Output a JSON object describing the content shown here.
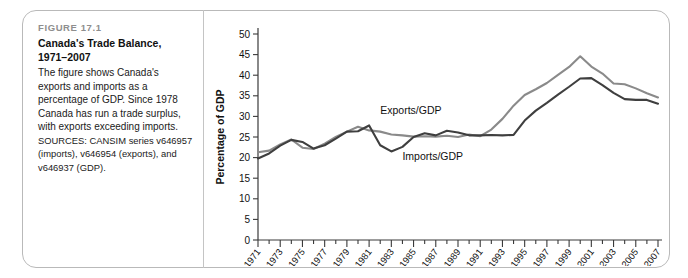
{
  "caption": {
    "figure_number": "FIGURE 17.1",
    "title_line1": "Canada's Trade Balance,",
    "title_line2": "1971–2007",
    "body": "The figure shows Canada's exports and imports as a percentage of GDP. Since 1978 Canada has run a trade surplus, with exports exceeding imports.",
    "sources": "SOURCES: CANSIM series v646957 (imports), v646954 (exports), and v646937 (GDP)."
  },
  "colors": {
    "exports_line": "#8a8a8a",
    "imports_line": "#3f3f3f",
    "axis": "#3a3a3a",
    "card_border": "#b9b9b9",
    "figure_number_text": "#8e8e8e"
  },
  "chart_data": {
    "type": "line",
    "title": "",
    "xlabel": "",
    "ylabel": "Percentage of GDP",
    "ylim": [
      0,
      50
    ],
    "ytick_values": [
      0,
      5,
      10,
      15,
      20,
      25,
      30,
      35,
      40,
      45,
      50
    ],
    "ytick_labels": [
      "0",
      "5",
      "10",
      "15",
      "20",
      "25",
      "30",
      "35",
      "40",
      "45",
      "50"
    ],
    "xlim": [
      1971,
      2007
    ],
    "x": [
      1971,
      1972,
      1973,
      1974,
      1975,
      1976,
      1977,
      1978,
      1979,
      1980,
      1981,
      1982,
      1983,
      1984,
      1985,
      1986,
      1987,
      1988,
      1989,
      1990,
      1991,
      1992,
      1993,
      1994,
      1995,
      1996,
      1997,
      1998,
      1999,
      2000,
      2001,
      2002,
      2003,
      2004,
      2005,
      2006,
      2007
    ],
    "xtick_labels": [
      "1971",
      "1973",
      "1975",
      "1977",
      "1979",
      "1981",
      "1983",
      "1985",
      "1987",
      "1989",
      "1991",
      "1993",
      "1995",
      "1997",
      "1999",
      "2001",
      "2003",
      "2005",
      "2007"
    ],
    "xtick_label_step": 2,
    "grid": false,
    "legend_position": "inline-annotation",
    "series": [
      {
        "name": "Exports/GDP",
        "color": "#8a8a8a",
        "values": [
          21.3,
          21.7,
          23.2,
          24.4,
          22.4,
          22.1,
          23.4,
          25.0,
          26.3,
          27.5,
          26.6,
          26.3,
          25.6,
          25.4,
          25.1,
          25.2,
          25.1,
          25.3,
          25.0,
          25.6,
          25.2,
          26.8,
          29.4,
          32.6,
          35.2,
          36.6,
          38.1,
          40.1,
          42.0,
          44.6,
          42.1,
          40.4,
          38.0,
          37.8,
          36.8,
          35.6,
          34.6
        ]
      },
      {
        "name": "Imports/GDP",
        "color": "#3f3f3f",
        "values": [
          19.8,
          21.0,
          22.9,
          24.3,
          23.8,
          22.2,
          23.0,
          24.6,
          26.3,
          26.4,
          27.8,
          23.0,
          21.5,
          22.6,
          25.0,
          25.9,
          25.4,
          26.5,
          26.1,
          25.4,
          25.4,
          25.5,
          25.4,
          25.5,
          29.0,
          31.4,
          33.3,
          35.3,
          37.2,
          39.2,
          39.3,
          37.6,
          35.7,
          34.2,
          34.0,
          34.0,
          33.1
        ]
      }
    ],
    "annotations": [
      {
        "text": "Exports/GDP",
        "x": 1982,
        "y": 30.5
      },
      {
        "text": "Imports/GDP",
        "x": 1984,
        "y": 19.5
      }
    ]
  }
}
